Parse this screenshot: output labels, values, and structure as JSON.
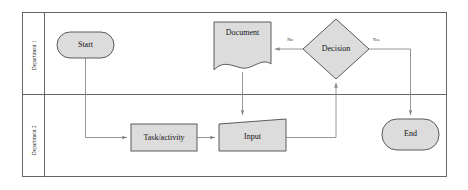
{
  "diagram": {
    "type": "swimlane-flowchart",
    "frame": {
      "x": 22,
      "y": 12,
      "width": 425,
      "height": 165
    },
    "lanes": [
      {
        "id": "lane-1",
        "label": "Department 1",
        "y": 12,
        "height": 82
      },
      {
        "id": "lane-2",
        "label": "Department 2",
        "y": 94,
        "height": 83
      }
    ],
    "nodes": [
      {
        "id": "start",
        "label": "Start",
        "shape": "stadium",
        "lane": "lane-1",
        "x": 57,
        "y": 32,
        "width": 57,
        "height": 26
      },
      {
        "id": "document",
        "label": "Document",
        "shape": "document",
        "lane": "lane-1",
        "x": 214,
        "y": 22,
        "width": 57,
        "height": 48
      },
      {
        "id": "decision",
        "label": "Decision",
        "shape": "diamond",
        "lane": "lane-1",
        "x": 303,
        "y": 19,
        "width": 66,
        "height": 60
      },
      {
        "id": "task",
        "label": "Task/activity",
        "shape": "rectangle",
        "lane": "lane-2",
        "x": 131,
        "y": 124,
        "width": 66,
        "height": 27
      },
      {
        "id": "input",
        "label": "Input",
        "shape": "trapezoid",
        "lane": "lane-2",
        "x": 219,
        "y": 119,
        "width": 67,
        "height": 32
      },
      {
        "id": "end",
        "label": "End",
        "shape": "stadium",
        "lane": "lane-2",
        "x": 382,
        "y": 119,
        "width": 57,
        "height": 31
      }
    ],
    "edges": [
      {
        "id": "edge-start-task",
        "from": "start",
        "to": "task",
        "label": ""
      },
      {
        "id": "edge-task-input",
        "from": "task",
        "to": "input",
        "label": ""
      },
      {
        "id": "edge-input-decision",
        "from": "input",
        "to": "decision",
        "label": ""
      },
      {
        "id": "edge-decision-document",
        "from": "decision",
        "to": "document",
        "label": "No"
      },
      {
        "id": "edge-decision-end",
        "from": "decision",
        "to": "end",
        "label": "Yes"
      },
      {
        "id": "edge-document-input",
        "from": "document",
        "to": "input",
        "label": ""
      }
    ],
    "colors": {
      "shape_fill": "#dcdcdc",
      "shape_stroke": "#4a4a4a",
      "connector": "#8a8a8a",
      "frame": "#555555",
      "text": "#111111",
      "background": "#ffffff"
    }
  }
}
